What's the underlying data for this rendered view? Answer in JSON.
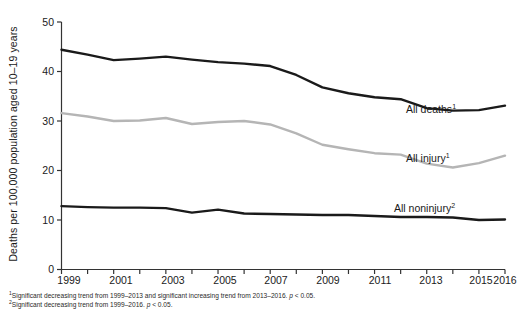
{
  "chart_data": {
    "type": "line",
    "title": "",
    "xlabel": "",
    "ylabel": "Deaths per 100,000 population aged 10–19 years",
    "xlim": [
      1999,
      2016
    ],
    "ylim": [
      0,
      50
    ],
    "yticks": [
      0,
      10,
      20,
      30,
      40,
      50
    ],
    "xticks": [
      1999,
      2000,
      2001,
      2002,
      2003,
      2004,
      2005,
      2006,
      2007,
      2008,
      2009,
      2010,
      2011,
      2012,
      2013,
      2014,
      2015,
      2016
    ],
    "xtick_labels": [
      "1999",
      "",
      "2001",
      "",
      "2003",
      "",
      "2005",
      "",
      "2007",
      "",
      "2009",
      "",
      "2011",
      "",
      "2013",
      "",
      "2015",
      "2016"
    ],
    "grid": false,
    "legend_position": "inline-right",
    "x": [
      1999,
      2000,
      2001,
      2002,
      2003,
      2004,
      2005,
      2006,
      2007,
      2008,
      2009,
      2010,
      2011,
      2012,
      2013,
      2014,
      2015,
      2016
    ],
    "series": [
      {
        "name": "All deaths",
        "footnote_marker": "1",
        "color": "#1a1a1a",
        "label": "All deaths",
        "values": [
          44.4,
          43.4,
          42.3,
          42.6,
          43.0,
          42.4,
          41.9,
          41.6,
          41.1,
          39.3,
          36.8,
          35.6,
          34.8,
          34.4,
          32.6,
          32.1,
          32.2,
          33.1
        ]
      },
      {
        "name": "All injury",
        "footnote_marker": "1",
        "color": "#b5b5b5",
        "label": "All injury",
        "values": [
          31.6,
          30.9,
          30.0,
          30.1,
          30.6,
          29.4,
          29.8,
          30.0,
          29.3,
          27.5,
          25.2,
          24.3,
          23.5,
          23.2,
          21.4,
          20.6,
          21.5,
          23.0
        ]
      },
      {
        "name": "All noninjury",
        "footnote_marker": "2",
        "color": "#1a1a1a",
        "label": "All noninjury",
        "values": [
          12.8,
          12.6,
          12.5,
          12.5,
          12.4,
          11.5,
          12.1,
          11.3,
          11.2,
          11.1,
          11.0,
          11.0,
          10.8,
          10.6,
          10.6,
          10.5,
          10.0,
          10.1
        ]
      }
    ],
    "footnotes": [
      {
        "marker": "1",
        "text_before": "Significant decreasing trend from 1999–2013 and significant increasing trend from 2013–2016. ",
        "p_italic": "p",
        "text_after": " < 0.05."
      },
      {
        "marker": "2",
        "text_before": "Significant decreasing trend from 1999–2016. ",
        "p_italic": "p",
        "text_after": " < 0.05."
      }
    ]
  },
  "axis": {
    "ytick_0": "0",
    "ytick_10": "10",
    "ytick_20": "20",
    "ytick_30": "30",
    "ytick_40": "40",
    "ytick_50": "50",
    "xtick_1999": "1999",
    "xtick_2001": "2001",
    "xtick_2003": "2003",
    "xtick_2005": "2005",
    "xtick_2007": "2007",
    "xtick_2009": "2009",
    "xtick_2011": "2011",
    "xtick_2013": "2013",
    "xtick_2015": "2015",
    "xtick_2016": "2016",
    "ylabel": "Deaths per 100,000 population aged 10–19 years"
  },
  "labels": {
    "all_deaths": "All deaths",
    "all_deaths_sup": "1",
    "all_injury": "All injury",
    "all_injury_sup": "1",
    "all_noninjury": "All noninjury",
    "all_noninjury_sup": "2"
  },
  "footnotes": {
    "one_marker": "1",
    "one_a": "Significant decreasing trend from 1999–2013 and significant increasing trend from 2013–2016. ",
    "one_p": "p",
    "one_b": " < 0.05.",
    "two_marker": "2",
    "two_a": "Significant decreasing trend from 1999–2016. ",
    "two_p": "p",
    "two_b": " < 0.05."
  }
}
